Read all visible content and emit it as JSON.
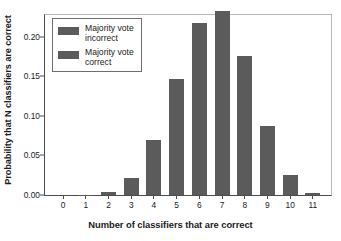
{
  "chart_data": {
    "type": "bar",
    "title": "",
    "xlabel": "Number of classifiers that are correct",
    "ylabel": "Probability that N classifiers are correct",
    "categories": [
      "0",
      "1",
      "2",
      "3",
      "4",
      "5",
      "6",
      "7",
      "8",
      "9",
      "10",
      "11"
    ],
    "values": [
      0.0,
      0.0005,
      0.004,
      0.022,
      0.069,
      0.146,
      0.218,
      0.233,
      0.176,
      0.087,
      0.025,
      0.002
    ],
    "series": [
      {
        "name": "Probability that N classifiers are correct",
        "values": [
          0.0,
          0.0005,
          0.004,
          0.022,
          0.069,
          0.146,
          0.218,
          0.233,
          0.176,
          0.087,
          0.025,
          0.002
        ]
      }
    ],
    "ylim": [
      0.0,
      0.2275
    ],
    "xlim": [
      -0.8,
      11.8
    ],
    "yticks": [
      0.0,
      0.05,
      0.1,
      0.15,
      0.2
    ],
    "ytick_labels": [
      "0.00",
      "0.05",
      "0.10",
      "0.15",
      "0.20"
    ],
    "xtick_labels": [
      "0",
      "1",
      "2",
      "3",
      "4",
      "5",
      "6",
      "7",
      "8",
      "9",
      "10",
      "11"
    ],
    "grid": false,
    "legend_position": "upper left",
    "bar_color": "#5b5b5b",
    "axis_color": "#4d4d4d",
    "frame_color": "#b9b9b9",
    "text_color": "#1b1b1b"
  },
  "legend": {
    "entries": [
      {
        "label": "Majority vote\nincorrect",
        "color": "#5b5b5b"
      },
      {
        "label": "Majority vote\ncorrect",
        "color": "#5b5b5b"
      }
    ]
  }
}
